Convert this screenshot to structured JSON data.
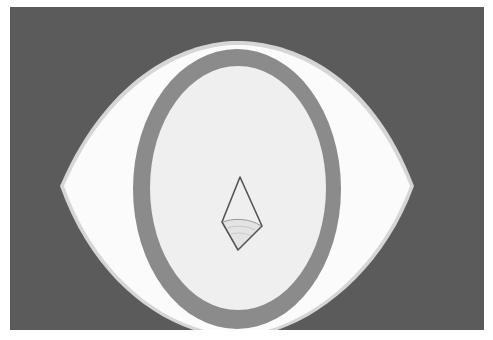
{
  "image": {
    "width": 493,
    "height": 340,
    "subject": "stylized eye with oval ring and small diamond in center",
    "colors": {
      "page": "#ffffff",
      "background": "#5b5b5b",
      "eye_outer": "#fafafa",
      "eye_edge": "#d9d9d9",
      "ring": "#8b8b8b",
      "inner": "#efefef",
      "diamond_stroke": "#555555",
      "diamond_shade": "#c8c8c8"
    },
    "shapes": {
      "background_rect": {
        "x": 10,
        "y": 7,
        "w": 474,
        "h": 323
      },
      "eye": {
        "left": [
          60,
          185
        ],
        "right": [
          412,
          185
        ],
        "top": [
          237,
          43
        ],
        "bottom": [
          237,
          330
        ]
      },
      "ring_outer": {
        "cx": 237,
        "cy": 189,
        "rx": 104,
        "ry": 140
      },
      "ring_inner": {
        "cx": 238,
        "cy": 188,
        "rx": 88,
        "ry": 122
      },
      "diamond": {
        "top": [
          240,
          177
        ],
        "left": [
          222,
          222
        ],
        "right": [
          262,
          227
        ],
        "bottom": [
          238,
          250
        ]
      }
    }
  }
}
